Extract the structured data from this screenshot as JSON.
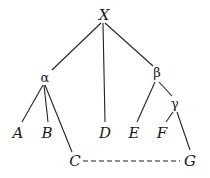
{
  "diagram": {
    "type": "tree",
    "nodes": {
      "X": {
        "label": "X"
      },
      "alpha": {
        "label": "α"
      },
      "beta": {
        "label": "β"
      },
      "gamma": {
        "label": "γ"
      },
      "A": {
        "label": "A"
      },
      "B": {
        "label": "B"
      },
      "C": {
        "label": "C"
      },
      "D": {
        "label": "D"
      },
      "E": {
        "label": "E"
      },
      "F": {
        "label": "F"
      },
      "G": {
        "label": "G"
      }
    },
    "edges": [
      {
        "from": "X",
        "to": "alpha",
        "style": "solid"
      },
      {
        "from": "X",
        "to": "D",
        "style": "solid"
      },
      {
        "from": "X",
        "to": "beta",
        "style": "solid"
      },
      {
        "from": "alpha",
        "to": "A",
        "style": "solid"
      },
      {
        "from": "alpha",
        "to": "B",
        "style": "solid"
      },
      {
        "from": "alpha",
        "to": "C",
        "style": "solid"
      },
      {
        "from": "beta",
        "to": "E",
        "style": "solid"
      },
      {
        "from": "beta",
        "to": "gamma",
        "style": "solid"
      },
      {
        "from": "gamma",
        "to": "F",
        "style": "solid"
      },
      {
        "from": "gamma",
        "to": "G",
        "style": "solid"
      },
      {
        "from": "C",
        "to": "G",
        "style": "dashed"
      }
    ]
  }
}
